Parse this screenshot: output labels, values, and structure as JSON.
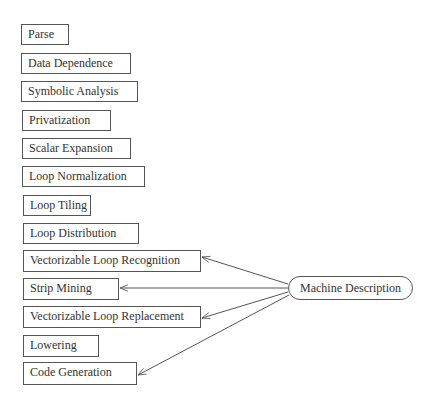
{
  "diagram": {
    "phases": [
      {
        "id": "parse",
        "label": "Parse"
      },
      {
        "id": "data-dependence",
        "label": "Data Dependence"
      },
      {
        "id": "symbolic-analysis",
        "label": "Symbolic Analysis"
      },
      {
        "id": "privatization",
        "label": "Privatization"
      },
      {
        "id": "scalar-expansion",
        "label": "Scalar Expansion"
      },
      {
        "id": "loop-normalization",
        "label": "Loop Normalization"
      },
      {
        "id": "loop-tiling",
        "label": "Loop Tiling"
      },
      {
        "id": "loop-distribution",
        "label": "Loop Distribution"
      },
      {
        "id": "vectorizable-loop-recognition",
        "label": "Vectorizable Loop Recognition"
      },
      {
        "id": "strip-mining",
        "label": "Strip Mining"
      },
      {
        "id": "vectorizable-loop-replacement",
        "label": "Vectorizable Loop Replacement"
      },
      {
        "id": "lowering",
        "label": "Lowering"
      },
      {
        "id": "code-generation",
        "label": "Code Generation"
      }
    ],
    "source": {
      "id": "machine-description",
      "label": "Machine Description"
    },
    "edges": [
      {
        "from": "machine-description",
        "to": "vectorizable-loop-recognition"
      },
      {
        "from": "machine-description",
        "to": "strip-mining"
      },
      {
        "from": "machine-description",
        "to": "vectorizable-loop-replacement"
      },
      {
        "from": "machine-description",
        "to": "code-generation"
      }
    ],
    "colors": {
      "stroke": "#555555",
      "text": "#333333",
      "background": "#ffffff"
    }
  }
}
